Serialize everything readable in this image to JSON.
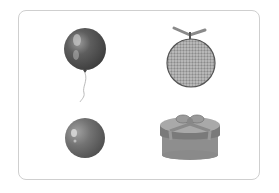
{
  "card": {
    "border_color": "#cfcfcf",
    "background": "#ffffff"
  },
  "items": [
    {
      "name": "balloon",
      "position": "top-left",
      "color": "#555555"
    },
    {
      "name": "melon",
      "position": "top-right",
      "color": "#8f8f8f"
    },
    {
      "name": "ball",
      "position": "bottom-left",
      "color": "#6a6a6a"
    },
    {
      "name": "gift-box",
      "position": "bottom-right",
      "color": "#8a8a8a"
    }
  ]
}
